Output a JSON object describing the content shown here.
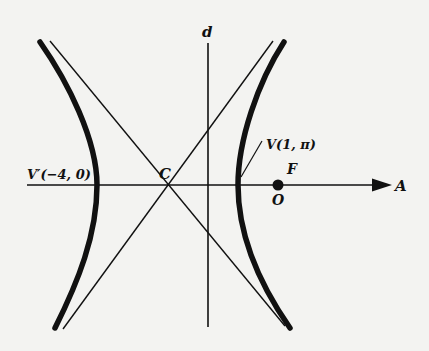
{
  "diagram": {
    "type": "hyperbola-polar-diagram",
    "colors": {
      "background": "#f3f3f1",
      "ink": "#111111"
    },
    "labels": {
      "directrix": "d",
      "center": "C",
      "vertex_left": "V′(−4, 0)",
      "vertex_right": "V(1, π)",
      "focus": "F",
      "pole": "O",
      "polar_axis": "A"
    },
    "elements": {
      "polar_axis": {
        "from": [
          27,
          185
        ],
        "to": [
          392,
          185
        ],
        "arrow": true
      },
      "directrix_line": {
        "from": [
          208,
          43
        ],
        "to": [
          208,
          327
        ]
      },
      "center_point": [
        167,
        185
      ],
      "focus_pole_point": [
        278,
        185
      ],
      "left_branch": {
        "vertex": [
          97,
          185
        ],
        "top_tip": [
          40,
          42
        ],
        "bottom_tip": [
          55,
          328
        ]
      },
      "right_branch": {
        "vertex": [
          238,
          185
        ],
        "top_tip": [
          283,
          42
        ],
        "bottom_tip": [
          290,
          328
        ]
      },
      "asymptote_1": {
        "from": [
          50,
          42
        ],
        "to": [
          285,
          326
        ]
      },
      "asymptote_2": {
        "from": [
          272,
          42
        ],
        "to": [
          63,
          328
        ]
      },
      "vertex_leader": {
        "from": [
          241,
          177
        ],
        "to": [
          262,
          141
        ]
      }
    }
  }
}
